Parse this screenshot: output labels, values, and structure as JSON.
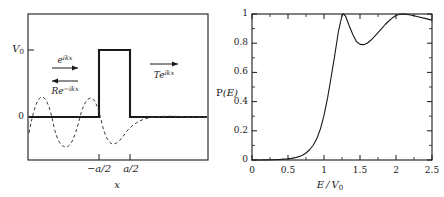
{
  "figure": {
    "background": "#ffffff",
    "ink": "#1a1a1a"
  },
  "left_panel": {
    "name": "square-barrier-potential-diagram",
    "yaxis": {
      "ticks": [
        {
          "label": "V",
          "sub": "0",
          "value": 1.0
        },
        {
          "label": "0",
          "sub": "",
          "value": 0.0
        }
      ]
    },
    "xaxis": {
      "title": "x",
      "ticks": [
        {
          "label": "−a/2",
          "value": -0.5
        },
        {
          "label": "a/2",
          "value": 0.5
        }
      ]
    },
    "annotations": {
      "incident": {
        "base": "e",
        "exp": "ikx",
        "arrow": "right-arrow"
      },
      "reflected": {
        "base": "Re",
        "exp": "−ikx",
        "arrow": "left-arrow"
      },
      "transmitted": {
        "base": "Te",
        "exp": "ikx",
        "arrow": "right-arrow"
      }
    },
    "barrier": {
      "height_label": "V0",
      "left_edge": -0.5,
      "right_edge": 0.5
    }
  },
  "right_panel": {
    "name": "transmission-probability-plot"
  },
  "chart_data": {
    "type": "line",
    "title": "",
    "xlabel": "E / V_0",
    "ylabel": "P(E)",
    "xlim": [
      0,
      2.5
    ],
    "ylim": [
      0,
      1
    ],
    "xticks": [
      0,
      0.5,
      1,
      1.5,
      2,
      2.5
    ],
    "xticklabels": [
      "0",
      "0.5",
      "1",
      "1.5",
      "2",
      "2.5"
    ],
    "yticks": [
      0,
      0.2,
      0.4,
      0.6,
      0.8,
      1
    ],
    "yticklabels": [
      "0",
      "0.2",
      "0.4",
      "0.6",
      "0.8",
      "1"
    ],
    "grid": false,
    "legend": null,
    "minor_ticks": true,
    "series": [
      {
        "name": "transmission-probability",
        "x": [
          0.0,
          0.1,
          0.2,
          0.3,
          0.4,
          0.5,
          0.55,
          0.6,
          0.65,
          0.7,
          0.75,
          0.8,
          0.85,
          0.9,
          0.95,
          1.0,
          1.05,
          1.1,
          1.15,
          1.2,
          1.25,
          1.27,
          1.3,
          1.35,
          1.4,
          1.45,
          1.5,
          1.55,
          1.6,
          1.65,
          1.7,
          1.75,
          1.8,
          1.85,
          1.9,
          1.95,
          2.0,
          2.05,
          2.08,
          2.12,
          2.18,
          2.25,
          2.32,
          2.4,
          2.5
        ],
        "y": [
          0.0,
          0.0,
          0.001,
          0.002,
          0.004,
          0.008,
          0.011,
          0.016,
          0.023,
          0.033,
          0.048,
          0.07,
          0.101,
          0.146,
          0.212,
          0.305,
          0.425,
          0.57,
          0.72,
          0.88,
          0.99,
          1.0,
          0.985,
          0.92,
          0.86,
          0.812,
          0.792,
          0.79,
          0.8,
          0.82,
          0.845,
          0.872,
          0.9,
          0.928,
          0.952,
          0.974,
          0.99,
          0.999,
          1.0,
          0.999,
          0.995,
          0.988,
          0.98,
          0.97,
          0.958
        ]
      }
    ]
  }
}
